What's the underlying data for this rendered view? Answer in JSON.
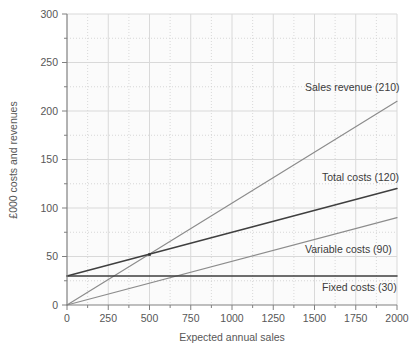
{
  "chart_data": {
    "type": "line",
    "title": "",
    "xlabel": "Expected annual sales",
    "ylabel": "£000 costs and revenues",
    "xlim": [
      0,
      2000
    ],
    "ylim": [
      0,
      300
    ],
    "x_ticks": [
      0,
      250,
      500,
      750,
      1000,
      1250,
      1500,
      1750,
      2000
    ],
    "x_tick_labels": [
      "0",
      "250",
      "500",
      "750",
      "1000",
      "1250",
      "1500",
      "1750",
      "2000"
    ],
    "x_minor_step": 125,
    "y_ticks": [
      0,
      50,
      100,
      150,
      200,
      250,
      300
    ],
    "y_tick_labels": [
      "0",
      "50",
      "100",
      "150",
      "200",
      "250",
      "300"
    ],
    "y_minor_step": 25,
    "grid": "major solid, minor dotted",
    "legend_position": "inline-right-labels",
    "series": [
      {
        "name": "Sales revenue (210)",
        "label": "Sales revenue (210)",
        "color": "#8c8c8c",
        "x": [
          0,
          2000
        ],
        "values": [
          0,
          210
        ]
      },
      {
        "name": "Total costs (120)",
        "label": "Total costs (120)",
        "color": "#3f3f3f",
        "x": [
          0,
          2000
        ],
        "values": [
          30,
          120
        ]
      },
      {
        "name": "Variable costs (90)",
        "label": "Variable costs (90)",
        "color": "#8c8c8c",
        "x": [
          0,
          2000
        ],
        "values": [
          0,
          90
        ]
      },
      {
        "name": "Fixed costs (30)",
        "label": "Fixed costs (30)",
        "color": "#3f3f3f",
        "x": [
          0,
          2000
        ],
        "values": [
          30,
          30
        ]
      }
    ],
    "annotations": [
      {
        "name": "break-even-point",
        "x": 500,
        "y": 52,
        "label": ""
      }
    ],
    "colors": {
      "axis": "#808080",
      "grid_major": "#d9d9d9",
      "grid_minor": "#cfcfcf",
      "plot_background": "#fbfbfb",
      "text": "#575757"
    }
  }
}
